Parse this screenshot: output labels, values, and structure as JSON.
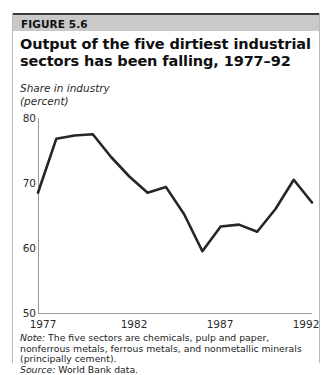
{
  "figure": {
    "band_label": "FIGURE 5.6",
    "title": "Output of the five dirtiest industrial sectors has been falling, 1977–92",
    "axis_caption_line1": "Share in industry",
    "axis_caption_line2": "(percent)",
    "note_lead": "Note:",
    "note_text": " The five sectors are chemicals, pulp and paper, nonferrous metals, ferrous metals, and nonmetallic minerals (principally cement).",
    "source_lead": "Source:",
    "source_text": " World Bank data.",
    "band_color": "#c9c9c9",
    "line_color": "#262626",
    "axis_color": "#9a9a9a"
  },
  "chart_data": {
    "type": "line",
    "title": "Output of the five dirtiest industrial sectors has been falling, 1977–92",
    "xlabel": "",
    "ylabel": "Share in industry (percent)",
    "ylim": [
      50,
      80
    ],
    "xlim": [
      1977,
      1992
    ],
    "yticks": [
      80,
      70,
      60,
      50
    ],
    "xticks": [
      1977,
      1982,
      1987,
      1992
    ],
    "grid": false,
    "legend": "none",
    "x": [
      1977,
      1978,
      1979,
      1980,
      1981,
      1982,
      1983,
      1984,
      1985,
      1986,
      1987,
      1988,
      1989,
      1990,
      1991,
      1992
    ],
    "values": [
      68.5,
      76.8,
      77.3,
      77.5,
      74.0,
      71.0,
      68.5,
      69.4,
      65.2,
      59.5,
      63.3,
      63.6,
      62.5,
      66.0,
      70.5,
      67.0
    ],
    "series": [
      {
        "name": "Share in industry (percent)",
        "values": [
          68.5,
          76.8,
          77.3,
          77.5,
          74.0,
          71.0,
          68.5,
          69.4,
          65.2,
          59.5,
          63.3,
          63.6,
          62.5,
          66.0,
          70.5,
          67.0
        ]
      }
    ]
  }
}
